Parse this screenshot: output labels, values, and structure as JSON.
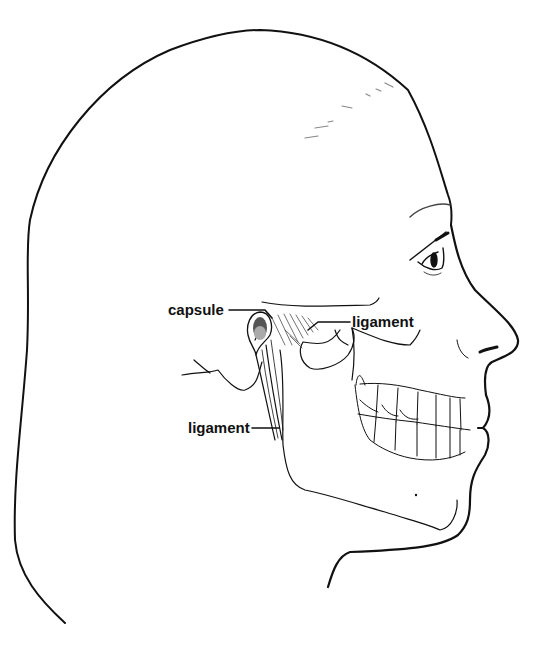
{
  "figure": {
    "labels": [
      {
        "id": "capsule",
        "text": "capsule"
      },
      {
        "id": "ligament-lateral",
        "text": "ligament"
      },
      {
        "id": "ligament-stylomandibular",
        "text": "ligament"
      }
    ]
  },
  "colors": {
    "ink": "#111111",
    "background": "#ffffff"
  }
}
